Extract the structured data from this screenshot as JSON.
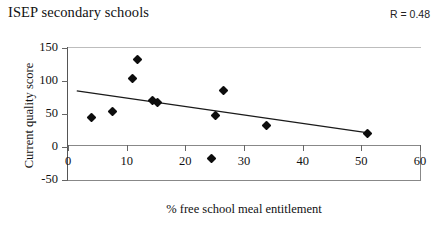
{
  "chart_data": {
    "type": "scatter",
    "title": "ISEP secondary schools",
    "xlabel": "% free school meal entitlement",
    "ylabel": "Current quality score",
    "annotation": "R = 0.48",
    "xlim": [
      0,
      60
    ],
    "ylim": [
      -50,
      150
    ],
    "xticks": [
      0,
      10,
      20,
      30,
      40,
      50,
      60
    ],
    "xtick_labels": [
      "0",
      "10",
      "20",
      "30",
      "40",
      "50",
      "60"
    ],
    "yticks": [
      -50,
      0,
      50,
      100,
      150
    ],
    "ytick_labels": [
      "-50",
      "0",
      "50",
      "100",
      "150"
    ],
    "grid": false,
    "legend": "none",
    "marker_shape": "diamond",
    "marker_color": "#0d0d0d",
    "trendline": {
      "visible": true,
      "color": "#1a1a1a",
      "x_start": 1.5,
      "y_start": 85,
      "x_end": 51.5,
      "y_end": 21
    },
    "points": [
      {
        "x": 4.0,
        "y": 45
      },
      {
        "x": 7.5,
        "y": 54
      },
      {
        "x": 11.0,
        "y": 104
      },
      {
        "x": 11.8,
        "y": 133
      },
      {
        "x": 14.4,
        "y": 70
      },
      {
        "x": 15.2,
        "y": 67
      },
      {
        "x": 24.5,
        "y": -18
      },
      {
        "x": 25.2,
        "y": 48
      },
      {
        "x": 26.5,
        "y": 85
      },
      {
        "x": 33.8,
        "y": 33
      },
      {
        "x": 51.0,
        "y": 20
      }
    ]
  }
}
